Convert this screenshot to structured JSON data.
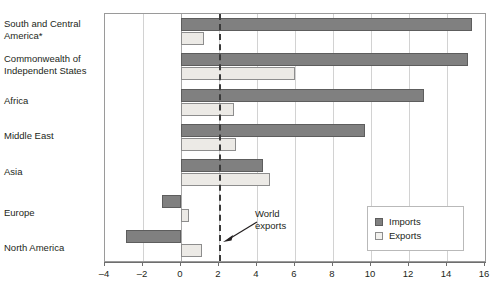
{
  "chart_data": {
    "type": "bar",
    "orientation": "horizontal",
    "title": "",
    "xlabel": "",
    "ylabel": "",
    "xlim": [
      -4,
      16
    ],
    "xticks": [
      -4,
      -2,
      0,
      2,
      4,
      6,
      8,
      10,
      12,
      14,
      16
    ],
    "xtick_labels": [
      "–4",
      "–2",
      "0",
      "2",
      "4",
      "6",
      "8",
      "10",
      "12",
      "14",
      "16"
    ],
    "grid": "vertical",
    "categories": [
      "South and Central America*",
      "Commonwealth of Independent States",
      "Africa",
      "Middle East",
      "Asia",
      "Europe",
      "North America"
    ],
    "series": [
      {
        "name": "Imports",
        "color": "#808080",
        "values": [
          15.3,
          15.1,
          12.8,
          9.7,
          4.3,
          -1.0,
          -2.9
        ]
      },
      {
        "name": "Exports",
        "color": "#eceae6",
        "values": [
          1.2,
          6.0,
          2.8,
          2.9,
          4.7,
          0.4,
          1.1
        ]
      }
    ],
    "reference_line": {
      "value": 2,
      "label": "World exports",
      "style": "dashed"
    },
    "legend": {
      "position": "bottom-right",
      "entries": [
        "Imports",
        "Exports"
      ]
    }
  },
  "category_labels": [
    {
      "line1": "South and Central",
      "line2": "America*"
    },
    {
      "line1": "Commonwealth of",
      "line2": "Independent States"
    },
    {
      "line1": "Africa",
      "line2": ""
    },
    {
      "line1": "Middle East",
      "line2": ""
    },
    {
      "line1": "Asia",
      "line2": ""
    },
    {
      "line1": "Europe",
      "line2": ""
    },
    {
      "line1": "North America",
      "line2": ""
    }
  ],
  "annotation": {
    "line1": "World",
    "line2": "exports"
  },
  "legend": {
    "imports_label": "Imports",
    "exports_label": "Exports"
  },
  "footnote": ""
}
